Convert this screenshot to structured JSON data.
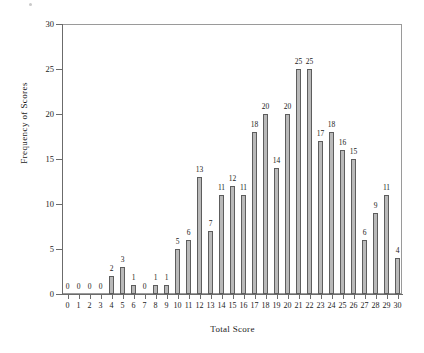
{
  "chart_data": {
    "type": "bar",
    "title": "",
    "subtitle": "",
    "xlabel": "Total Score",
    "ylabel": "Frequency of Scores",
    "categories": [
      "0",
      "1",
      "2",
      "3",
      "4",
      "5",
      "6",
      "7",
      "8",
      "9",
      "10",
      "11",
      "12",
      "13",
      "14",
      "15",
      "16",
      "17",
      "18",
      "19",
      "20",
      "21",
      "22",
      "23",
      "24",
      "25",
      "26",
      "27",
      "28",
      "29",
      "30"
    ],
    "values": [
      0,
      0,
      0,
      0,
      2,
      3,
      1,
      0,
      1,
      1,
      5,
      6,
      13,
      7,
      11,
      12,
      11,
      18,
      20,
      14,
      20,
      25,
      25,
      17,
      18,
      16,
      15,
      6,
      9,
      11,
      4
    ],
    "data_labels": [
      "0",
      "0",
      "0",
      "0",
      "2",
      "3",
      "1",
      "0",
      "1",
      "1",
      "5",
      "6",
      "13",
      "7",
      "11",
      "12",
      "11",
      "18",
      "20",
      "14",
      "20",
      "25",
      "25",
      "17",
      "18",
      "16",
      "15",
      "6",
      "9",
      "11",
      "4"
    ],
    "xlim": [
      0,
      30
    ],
    "ylim": [
      0,
      30
    ],
    "ytick_labels": [
      "0",
      "5",
      "10",
      "15",
      "20",
      "25",
      "30"
    ],
    "ytick_values": [
      0,
      5,
      10,
      15,
      20,
      25,
      30
    ],
    "xtick_labels": [
      "0",
      "1",
      "2",
      "3",
      "4",
      "5",
      "6",
      "7",
      "8",
      "9",
      "10",
      "11",
      "12",
      "13",
      "14",
      "15",
      "16",
      "17",
      "18",
      "19",
      "20",
      "21",
      "22",
      "23",
      "24",
      "25",
      "26",
      "27",
      "28",
      "29",
      "30"
    ],
    "grid": false,
    "legend": null,
    "legend_position": "none",
    "bar_fill_color": "#b9b9b9",
    "bar_edge_color": "#5d5d5d",
    "axis_color": "#6b6b6b",
    "plot_border_color": "#9a9a9a",
    "background_color": "#ffffff",
    "show_data_labels": true
  }
}
